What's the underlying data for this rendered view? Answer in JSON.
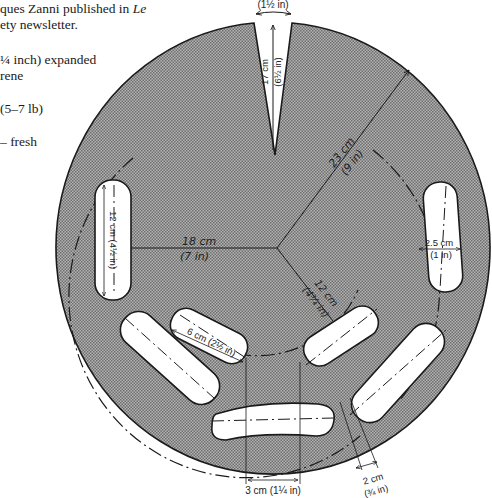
{
  "text": {
    "line1_pre": "ques Zanni published in ",
    "line1_italic": "Le",
    "line2": "ety newsletter.",
    "line3": "¼ inch) expanded",
    "line4": "rene",
    "line5": "(5–7 lb)",
    "line6": "– fresh"
  },
  "diagram": {
    "slot_width_label": "(1½ in)",
    "slot_length_cm": "17 cm",
    "slot_length_in": "(6½ in)",
    "outer_radius_cm": "23 cm",
    "outer_radius_in": "(9 in)",
    "inner_left_cm": "18 cm",
    "inner_left_in": "(7 in)",
    "inner_radius_cm": "12 cm",
    "inner_radius_in": "(4¾ in)",
    "left_sausage_length": "12 cm (4½ in)",
    "right_sausage_width_cm": "2.5 cm",
    "right_sausage_width_in": "(1 in)",
    "inner_sausage_length": "6 cm (2½ in)",
    "bottom_gap": "3 cm (1¼ in)",
    "small_gap_cm": "2 cm",
    "small_gap_in": "(¾ in)"
  },
  "colors": {
    "disc_fill": "#9a9a9a",
    "outline": "#1a1a1a",
    "sausage_fill": "#ffffff"
  }
}
